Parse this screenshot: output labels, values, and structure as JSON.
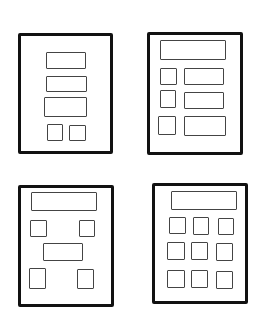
{
  "colors": {
    "frame_stroke": "#111111",
    "box_stroke": "#444444",
    "background": "#ffffff"
  },
  "wireframes": [
    {
      "id": "layout-1",
      "description": "Centered stack: three wide bars and two small squares",
      "frame": {
        "x": 18,
        "y": 33,
        "w": 95,
        "h": 121
      },
      "boxes": [
        {
          "x": 46,
          "y": 52,
          "w": 40,
          "h": 17
        },
        {
          "x": 46,
          "y": 76,
          "w": 41,
          "h": 16
        },
        {
          "x": 44,
          "y": 97,
          "w": 43,
          "h": 20
        },
        {
          "x": 47,
          "y": 124,
          "w": 16,
          "h": 17
        },
        {
          "x": 69,
          "y": 125,
          "w": 17,
          "h": 16
        }
      ]
    },
    {
      "id": "layout-2",
      "description": "Header bar with three rows of small square plus wide bar",
      "frame": {
        "x": 147,
        "y": 32,
        "w": 96,
        "h": 123
      },
      "boxes": [
        {
          "x": 160,
          "y": 40,
          "w": 66,
          "h": 20
        },
        {
          "x": 160,
          "y": 68,
          "w": 17,
          "h": 17
        },
        {
          "x": 184,
          "y": 68,
          "w": 40,
          "h": 17
        },
        {
          "x": 160,
          "y": 90,
          "w": 16,
          "h": 18
        },
        {
          "x": 184,
          "y": 92,
          "w": 40,
          "h": 17
        },
        {
          "x": 158,
          "y": 116,
          "w": 18,
          "h": 19
        },
        {
          "x": 184,
          "y": 116,
          "w": 42,
          "h": 20
        }
      ]
    },
    {
      "id": "layout-3",
      "description": "Header bar, two corner squares, centered bar, two corner squares",
      "frame": {
        "x": 18,
        "y": 185,
        "w": 96,
        "h": 122
      },
      "boxes": [
        {
          "x": 31,
          "y": 192,
          "w": 66,
          "h": 19
        },
        {
          "x": 30,
          "y": 220,
          "w": 17,
          "h": 17
        },
        {
          "x": 79,
          "y": 220,
          "w": 16,
          "h": 17
        },
        {
          "x": 43,
          "y": 243,
          "w": 40,
          "h": 18
        },
        {
          "x": 29,
          "y": 268,
          "w": 17,
          "h": 21
        },
        {
          "x": 77,
          "y": 269,
          "w": 17,
          "h": 20
        }
      ]
    },
    {
      "id": "layout-4",
      "description": "Header bar with 3x3 grid of squares",
      "frame": {
        "x": 152,
        "y": 183,
        "w": 96,
        "h": 121
      },
      "boxes": [
        {
          "x": 171,
          "y": 191,
          "w": 66,
          "h": 19
        },
        {
          "x": 169,
          "y": 217,
          "w": 17,
          "h": 17
        },
        {
          "x": 193,
          "y": 217,
          "w": 16,
          "h": 18
        },
        {
          "x": 218,
          "y": 218,
          "w": 16,
          "h": 17
        },
        {
          "x": 167,
          "y": 242,
          "w": 18,
          "h": 18
        },
        {
          "x": 191,
          "y": 242,
          "w": 17,
          "h": 18
        },
        {
          "x": 216,
          "y": 243,
          "w": 17,
          "h": 18
        },
        {
          "x": 167,
          "y": 270,
          "w": 18,
          "h": 18
        },
        {
          "x": 191,
          "y": 270,
          "w": 17,
          "h": 18
        },
        {
          "x": 216,
          "y": 271,
          "w": 17,
          "h": 18
        }
      ]
    }
  ]
}
